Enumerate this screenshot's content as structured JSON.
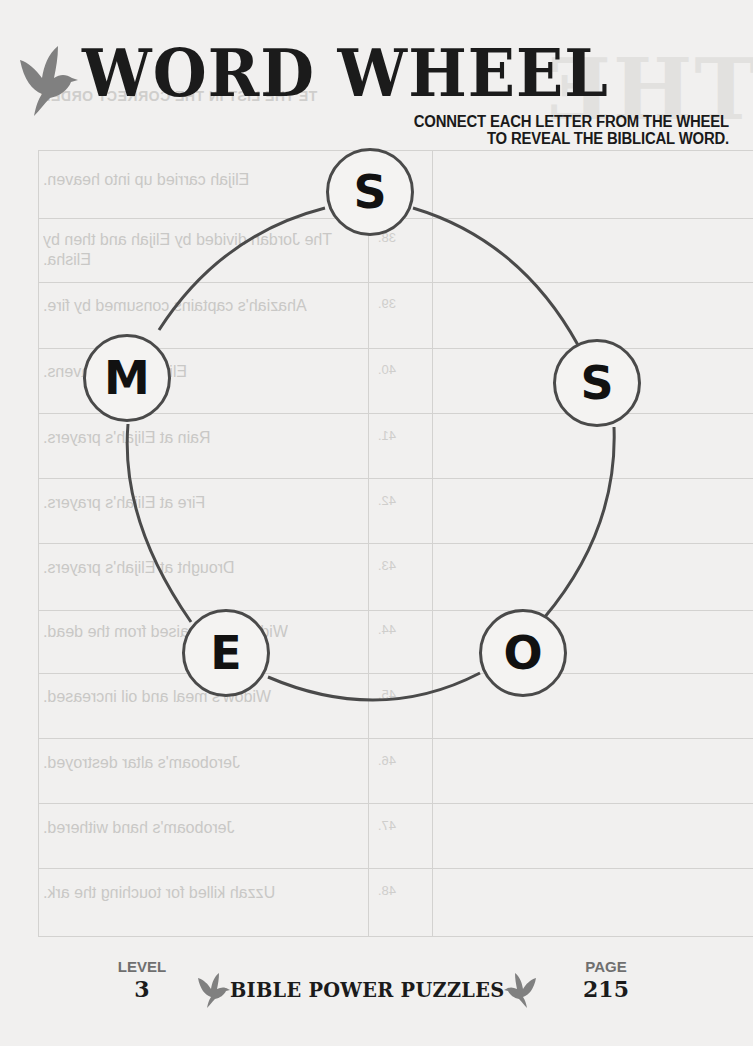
{
  "header": {
    "title": "WORD WHEEL",
    "instructions_line1": "CONNECT EACH LETTER FROM THE WHEEL",
    "instructions_line2": "TO REVEAL THE BIBLICAL WORD.",
    "icon": "dove-icon"
  },
  "wheel": {
    "letters": [
      {
        "letter": "S",
        "position": "top"
      },
      {
        "letter": "S",
        "position": "right"
      },
      {
        "letter": "O",
        "position": "bottom-right"
      },
      {
        "letter": "E",
        "position": "bottom-left"
      },
      {
        "letter": "M",
        "position": "left"
      }
    ],
    "node_color": "#4a4a4a",
    "line_color": "#4a4a4a"
  },
  "bleed_through": {
    "title": "THE",
    "subtitle": "TE THE LIST IN THE CORRECT ORDER",
    "rows": [
      {
        "num": "37.",
        "text": "Elijah carried up into heaven."
      },
      {
        "num": "38.",
        "text": "The Jordan divided by Elijah and then by Elisha."
      },
      {
        "num": "39.",
        "text": "Ahaziah's captains consumed by fire."
      },
      {
        "num": "40.",
        "text": "Elijah fed by ravens."
      },
      {
        "num": "41.",
        "text": "Rain at Elijah's prayers."
      },
      {
        "num": "42.",
        "text": "Fire at Elijah's prayers."
      },
      {
        "num": "43.",
        "text": "Drought at Elijah's prayers."
      },
      {
        "num": "44.",
        "text": "Widow's son raised from the dead."
      },
      {
        "num": "45.",
        "text": "Widow's meal and oil increased."
      },
      {
        "num": "46.",
        "text": "Jeroboam's altar destroyed."
      },
      {
        "num": "47.",
        "text": "Jeroboam's hand withered."
      },
      {
        "num": "48.",
        "text": "Uzzah killed for touching the ark."
      }
    ]
  },
  "footer": {
    "level_label": "LEVEL",
    "level_value": "3",
    "brand": "BIBLE POWER PUZZLES",
    "page_label": "PAGE",
    "page_value": "215"
  },
  "colors": {
    "background": "#f1f0ef",
    "dove": "#808080",
    "text": "#1b1b1b",
    "label_gray": "#6f6f6f"
  }
}
